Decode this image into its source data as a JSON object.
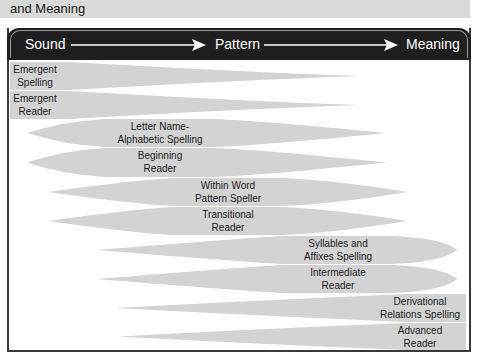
{
  "caption": "and Meaning",
  "header": {
    "labels": [
      "Sound",
      "Pattern",
      "Meaning"
    ]
  },
  "colors": {
    "header_bg": "#1e1e1e",
    "shape_fill": "#d3d3d3",
    "frame": "#3a3a3a",
    "caption_bg": "#d9d9d9"
  },
  "stages": [
    {
      "line1": "Emergent",
      "line2": "Spelling"
    },
    {
      "line1": "Emergent",
      "line2": "Reader"
    },
    {
      "line1": "Letter Name-",
      "line2": "Alphabetic Spelling"
    },
    {
      "line1": "Beginning",
      "line2": "Reader"
    },
    {
      "line1": "Within Word",
      "line2": "Pattern Speller"
    },
    {
      "line1": "Transitional",
      "line2": "Reader"
    },
    {
      "line1": "Syllables and",
      "line2": "Affixes Spelling"
    },
    {
      "line1": "Intermediate",
      "line2": "Reader"
    },
    {
      "line1": "Derivational",
      "line2": "Relations Spelling"
    },
    {
      "line1": "Advanced",
      "line2": "Reader"
    }
  ]
}
